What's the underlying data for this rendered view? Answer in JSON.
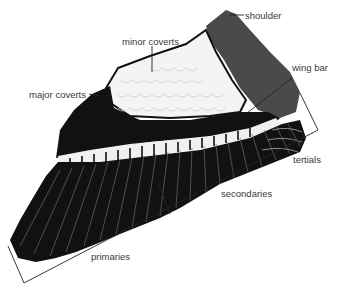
{
  "figure": {
    "labels": {
      "shoulder": "shoulder",
      "minor_coverts": "minor coverts",
      "major_coverts": "major coverts",
      "wing_bar": "wing bar",
      "tertials": "tertials",
      "secondaries": "secondaries",
      "primaries": "primaries"
    },
    "colors": {
      "feather_black": "#111111",
      "shoulder_gray": "#4a4a4a",
      "covert_white": "#f4f4f4",
      "label_text": "#3a3a3a",
      "leader_line": "#222222"
    }
  }
}
